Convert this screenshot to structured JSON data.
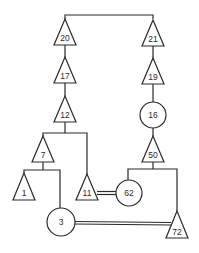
{
  "diagram": {
    "type": "pedigree",
    "nodes": [
      {
        "id": "20",
        "label": "20",
        "shape": "triangle"
      },
      {
        "id": "21",
        "label": "21",
        "shape": "triangle"
      },
      {
        "id": "17",
        "label": "17",
        "shape": "triangle"
      },
      {
        "id": "19",
        "label": "19",
        "shape": "triangle"
      },
      {
        "id": "12",
        "label": "12",
        "shape": "triangle"
      },
      {
        "id": "16",
        "label": "16",
        "shape": "circle"
      },
      {
        "id": "7",
        "label": "7",
        "shape": "triangle"
      },
      {
        "id": "50",
        "label": "50",
        "shape": "triangle"
      },
      {
        "id": "1",
        "label": "1",
        "shape": "triangle"
      },
      {
        "id": "11",
        "label": "11",
        "shape": "triangle"
      },
      {
        "id": "62",
        "label": "62",
        "shape": "circle"
      },
      {
        "id": "3",
        "label": "3",
        "shape": "circle"
      },
      {
        "id": "72",
        "label": "72",
        "shape": "triangle"
      }
    ],
    "edges": [
      {
        "from": "20",
        "to": "21",
        "type": "sibling"
      },
      {
        "from": "20",
        "to": "17",
        "type": "descent"
      },
      {
        "from": "17",
        "to": "12",
        "type": "descent"
      },
      {
        "from": "21",
        "to": "19",
        "type": "descent"
      },
      {
        "from": "19",
        "to": "16",
        "type": "descent"
      },
      {
        "from": "16",
        "to": "50",
        "type": "descent"
      },
      {
        "from": "12",
        "to": "7",
        "type": "descent"
      },
      {
        "from": "12",
        "to": "11",
        "type": "descent"
      },
      {
        "from": "7",
        "to": "1",
        "type": "descent"
      },
      {
        "from": "7",
        "to": "3",
        "type": "descent"
      },
      {
        "from": "50",
        "to": "62",
        "type": "descent"
      },
      {
        "from": "50",
        "to": "72",
        "type": "descent"
      },
      {
        "from": "11",
        "to": "62",
        "type": "marriage"
      },
      {
        "from": "3",
        "to": "72",
        "type": "marriage"
      }
    ]
  },
  "labels": {
    "n20": "20",
    "n21": "21",
    "n17": "17",
    "n19": "19",
    "n12": "12",
    "n16": "16",
    "n7": "7",
    "n50": "50",
    "n1": "1",
    "n11": "11",
    "n62": "62",
    "n3": "3",
    "n72": "72"
  }
}
